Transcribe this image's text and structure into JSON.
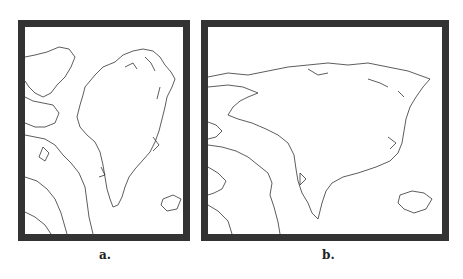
{
  "panels": [
    {
      "label": "a.",
      "description": "Map of Greenland and Canadian Arctic Archipelago, portrait projection"
    },
    {
      "label": "b.",
      "description": "Map of Greenland and Canadian Arctic Archipelago, wide projection"
    }
  ],
  "colors": {
    "frame": "#333333",
    "coastline": "#333333",
    "background": "#ffffff"
  }
}
